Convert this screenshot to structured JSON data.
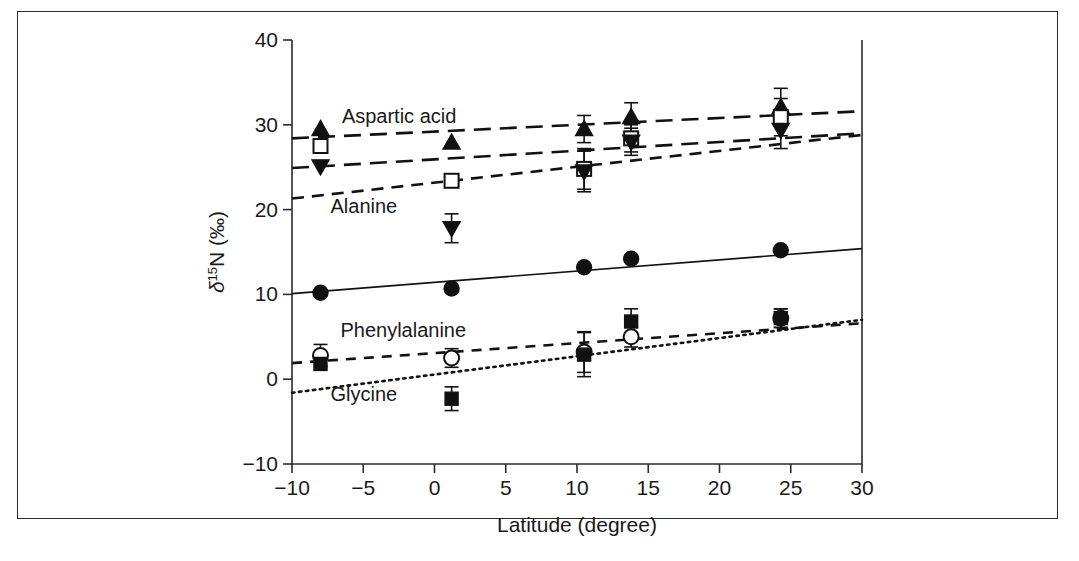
{
  "figure": {
    "type": "scientific-scatter-figure",
    "background": "#ffffff",
    "border_color": "#2b2b2b"
  },
  "chart_data": {
    "type": "scatter",
    "title": "",
    "xlabel": "Latitude (degree)",
    "ylabel": "δ¹⁵N (‰)",
    "ylabel_parts": {
      "delta": "δ",
      "superscript": "15",
      "rest": "N (‰)"
    },
    "xlim": [
      -10,
      30
    ],
    "ylim": [
      -10,
      40
    ],
    "xticks": [
      -10,
      -5,
      0,
      5,
      10,
      15,
      20,
      25,
      30
    ],
    "xticklabels": [
      "-10",
      "-5",
      "0",
      "5",
      "10",
      "15",
      "20",
      "25",
      "30"
    ],
    "yticks": [
      -10,
      0,
      10,
      20,
      30,
      40
    ],
    "yticklabels": [
      "-10",
      "0",
      "10",
      "20",
      "30",
      "40"
    ],
    "grid": false,
    "legend": "inline-annotations",
    "x": [
      -8.0,
      1.2,
      10.5,
      13.8,
      24.3
    ],
    "annotations": [
      {
        "text": "Aspartic acid",
        "x": -6.5,
        "y": 30.2
      },
      {
        "text": "Alanine",
        "x": -7.3,
        "y": 19.6
      },
      {
        "text": "Phenylalanine",
        "x": -6.6,
        "y": 5.0
      },
      {
        "text": "Glycine",
        "x": -7.3,
        "y": -2.6
      }
    ],
    "series": [
      {
        "name": "Aspartic acid",
        "marker": "triangle-up-filled",
        "linestyle": "long-dash",
        "values": [
          29.5,
          27.9,
          29.5,
          30.9,
          32.1
        ],
        "errors": [
          0.0,
          0.0,
          1.6,
          1.7,
          2.2
        ],
        "fit": {
          "y_at_xmin": 28.4,
          "y_at_xmax": 31.6
        }
      },
      {
        "name": "Alanine",
        "marker": "square-open",
        "linestyle": "medium-dash",
        "values": [
          27.5,
          23.4,
          24.8,
          28.4,
          30.9
        ],
        "errors": [
          0.0,
          0.0,
          2.4,
          1.6,
          2.2
        ],
        "fit": {
          "y_at_xmin": 21.3,
          "y_at_xmax": 28.8
        }
      },
      {
        "name": "Alanine-lower",
        "marker": "triangle-down-filled",
        "linestyle": "long-dash",
        "values": [
          25.1,
          17.8,
          24.5,
          28.0,
          29.4
        ],
        "errors": [
          0.0,
          1.7,
          2.4,
          1.6,
          2.2
        ],
        "fit": {
          "y_at_xmin": 24.9,
          "y_at_xmax": 29.0
        }
      },
      {
        "name": "Glutamic acid",
        "marker": "circle-filled",
        "linestyle": "solid",
        "values": [
          10.2,
          10.7,
          13.2,
          14.2,
          15.2
        ],
        "errors": [
          0.0,
          0.0,
          0.0,
          0.0,
          0.0
        ],
        "fit": {
          "y_at_xmin": 10.1,
          "y_at_xmax": 15.4
        }
      },
      {
        "name": "Phenylalanine",
        "marker": "circle-open",
        "linestyle": "dash",
        "values": [
          2.8,
          2.5,
          3.2,
          5.0,
          7.2
        ],
        "errors": [
          1.3,
          1.1,
          2.4,
          1.2,
          1.1
        ],
        "fit": {
          "y_at_xmin": 1.9,
          "y_at_xmax": 6.6
        }
      },
      {
        "name": "Glycine",
        "marker": "square-filled",
        "linestyle": "dotted",
        "values": [
          1.8,
          -2.3,
          2.9,
          6.8,
          7.2
        ],
        "errors": [
          0.0,
          1.4,
          2.6,
          1.5,
          1.1
        ],
        "fit": {
          "y_at_xmin": -1.6,
          "y_at_xmax": 7.0
        }
      }
    ]
  }
}
